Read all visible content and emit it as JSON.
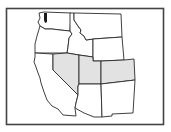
{
  "map": {
    "title": "Western United States",
    "region": "Western US",
    "colors": {
      "background": "#ffffff",
      "border": "#2a2a2a",
      "highlight_fill": "#e2e2e2",
      "default_fill": "#ffffff",
      "water": "#1a1a1a"
    },
    "highlighted_states": [
      "Nevada",
      "Utah",
      "Colorado"
    ],
    "states": [
      {
        "name": "Washington",
        "highlighted": false
      },
      {
        "name": "Oregon",
        "highlighted": false
      },
      {
        "name": "California",
        "highlighted": false
      },
      {
        "name": "Idaho",
        "highlighted": false
      },
      {
        "name": "Montana",
        "highlighted": false
      },
      {
        "name": "Wyoming",
        "highlighted": false
      },
      {
        "name": "Nevada",
        "highlighted": true
      },
      {
        "name": "Utah",
        "highlighted": true
      },
      {
        "name": "Colorado",
        "highlighted": true
      },
      {
        "name": "Arizona",
        "highlighted": false
      },
      {
        "name": "New Mexico",
        "highlighted": false
      }
    ]
  }
}
